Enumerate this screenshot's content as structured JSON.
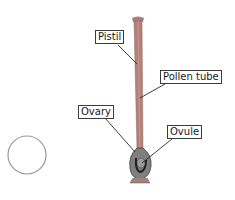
{
  "diagram": {
    "labels": {
      "pistil": "Pistil",
      "pollen_tube": "Pollen tube",
      "ovary": "Ovary",
      "ovule": "Ovule"
    },
    "colors": {
      "pistil_stalk": "#b07a72",
      "ovary_body": "#7d7d7d",
      "leader_line": "#2a2a2a",
      "circle_outline": "#8a8a8a"
    }
  }
}
